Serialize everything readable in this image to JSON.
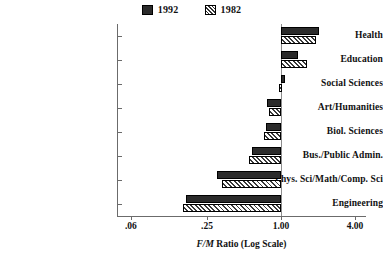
{
  "legend": {
    "entries": [
      {
        "label": "1992",
        "swatch": "solid-dark-swatch",
        "color": "#2b2b2b"
      },
      {
        "label": "1982",
        "swatch": "hatched-swatch",
        "color": "#ffffff"
      }
    ]
  },
  "axis": {
    "x_title_prefix": "F/M",
    "x_title_rest": " Ratio (Log Scale)",
    "x_title_full": "F/M Ratio (Log Scale)",
    "x_ticks": [
      ".06",
      ".25",
      "1.00",
      "4.00"
    ]
  },
  "chart_data": {
    "type": "bar",
    "orientation": "horizontal",
    "title": "",
    "xlabel": "F/M Ratio (Log Scale)",
    "ylabel": "",
    "xscale": "log",
    "xlim": [
      0.06,
      4.0
    ],
    "xticks": [
      0.06,
      0.25,
      1.0,
      4.0
    ],
    "xticklabels": [
      ".06",
      ".25",
      "1.00",
      "4.00"
    ],
    "grid": false,
    "reference_line": 1.0,
    "legend_position": "top-center",
    "categories": [
      "Health",
      "Education",
      "Social Sciences",
      "Art/Humanities",
      "Biol. Sciences",
      "Bus./Public Admin.",
      "Phys. Sci/Math/Comp. Sci",
      "Engineering"
    ],
    "series": [
      {
        "name": "1992",
        "color": "#2b2b2b",
        "values": [
          2.03,
          1.37,
          1.07,
          0.77,
          0.75,
          0.58,
          0.3,
          0.17
        ]
      },
      {
        "name": "1982",
        "color": "#ffffff",
        "pattern": "diagonal-hatch",
        "values": [
          1.93,
          1.62,
          0.96,
          0.8,
          0.73,
          0.55,
          0.33,
          0.16
        ]
      }
    ]
  }
}
